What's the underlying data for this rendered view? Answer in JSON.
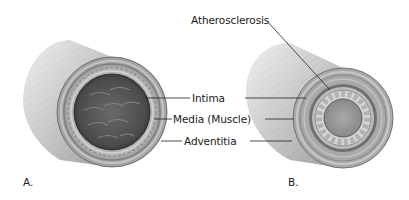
{
  "figure": {
    "panels": [
      {
        "id": "A",
        "label": "A.",
        "description": "Normal artery cross-section"
      },
      {
        "id": "B",
        "label": "B.",
        "description": "Artery with atherosclerosis"
      }
    ],
    "labels": {
      "intima": "Intima",
      "media": "Media (Muscle)",
      "adventitia": "Adventitia",
      "atherosclerosis": "Atherosclerosis"
    },
    "colors": {
      "background": "#ffffff",
      "text": "#1a1a1a",
      "leader_line": "#222222",
      "lumen_dark": "#4a4a4a",
      "wall_mid": "#9a9a9a",
      "wall_light": "#d0d0d0",
      "plaque": "#c8c8c8"
    }
  }
}
